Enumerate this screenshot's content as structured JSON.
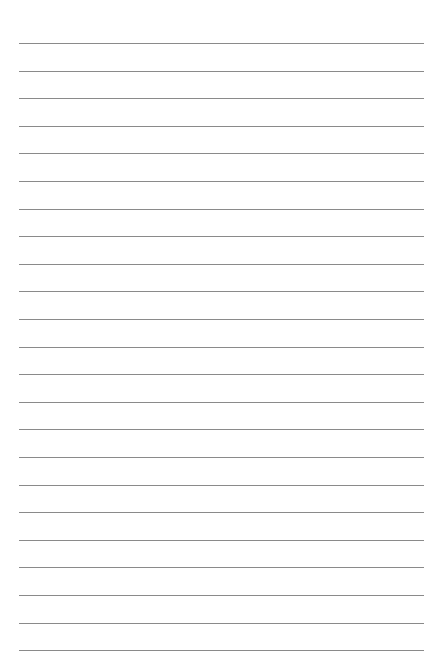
{
  "page": {
    "type": "lined-paper",
    "line_count": 23,
    "first_line_y": 43,
    "line_spacing": 27.6,
    "line_color": "#8a8a8a",
    "background_color": "#ffffff"
  }
}
